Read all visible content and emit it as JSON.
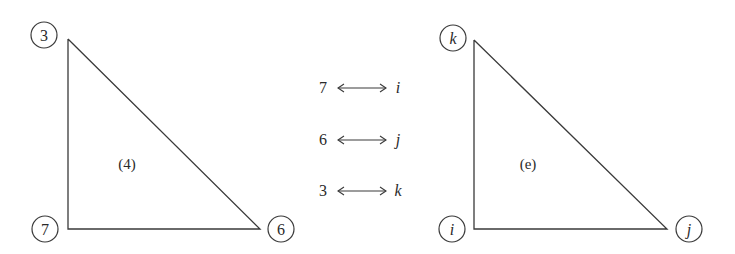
{
  "diagram": {
    "left_element": {
      "label": "(4)",
      "nodes": [
        {
          "id": "3",
          "label": "3",
          "position": "top"
        },
        {
          "id": "7",
          "label": "7",
          "position": "bottom-left"
        },
        {
          "id": "6",
          "label": "6",
          "position": "bottom-right"
        }
      ]
    },
    "mapping": [
      {
        "global": "7",
        "local": "i"
      },
      {
        "global": "6",
        "local": "j"
      },
      {
        "global": "3",
        "local": "k"
      }
    ],
    "right_element": {
      "label": "(e)",
      "nodes": [
        {
          "id": "k",
          "label": "k",
          "position": "top"
        },
        {
          "id": "i",
          "label": "i",
          "position": "bottom-left"
        },
        {
          "id": "j",
          "label": "j",
          "position": "bottom-right"
        }
      ]
    },
    "colors": {
      "line": "#3a3a3a",
      "text": "#2a2a2a",
      "background": "#ffffff"
    }
  }
}
